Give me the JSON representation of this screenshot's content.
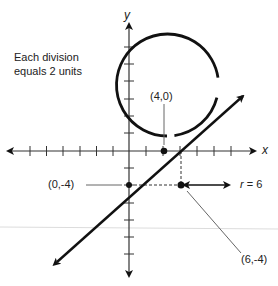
{
  "note": {
    "line1": "Each division",
    "line2": "equals 2 units"
  },
  "axes": {
    "x_label": "x",
    "y_label": "y",
    "units_per_division": 2
  },
  "labels": {
    "point_intercept_x": "(4,0)",
    "point_intercept_y": "(0,-4)",
    "center": "(6,-4)",
    "radius_prefix": "r",
    "radius_text": " = 6"
  },
  "diagram": {
    "circle": {
      "center": [
        6,
        -4
      ],
      "radius": 6
    },
    "line": {
      "through": [
        [
          0,
          -4
        ],
        [
          4,
          0
        ]
      ],
      "slope": 1
    },
    "colors": {
      "stroke": "#111111",
      "axis": "#333333",
      "leader": "#555555"
    }
  }
}
